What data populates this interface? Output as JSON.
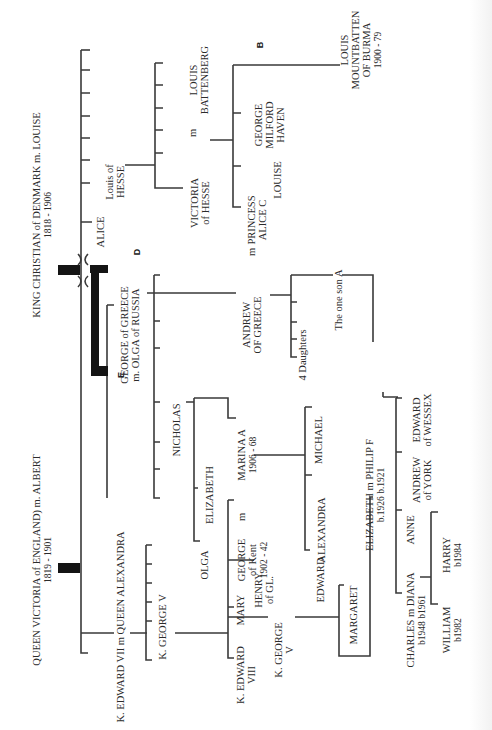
{
  "diagram": {
    "orientation": "rotated -90 degrees (read bottom to top)",
    "colors": {
      "line": "#3a3a3a",
      "text": "#2b2b2b",
      "bar": "#141414",
      "background": "#ffffff"
    },
    "labels": [
      {
        "id": "victoria",
        "lines": [
          "QUEEN VICTORIA of ENGLAND)  m. ALBERT",
          "1819 - 1901"
        ],
        "x": 40,
        "y": 560
      },
      {
        "id": "christian",
        "lines": [
          "KING CHRISTIAN of DENMARK   m. LOUISE",
          "1818 - 1906"
        ],
        "x": 40,
        "y": 215
      },
      {
        "id": "edward-vii",
        "lines": [
          "K. EDWARD VII   m  QUEEN ALEXANDRA"
        ],
        "x": 124,
        "y": 627
      },
      {
        "id": "marker-e",
        "lines": [
          "E"
        ],
        "x": 124,
        "y": 375,
        "bold": true
      },
      {
        "id": "george-v-1",
        "lines": [
          "K. GEORGE V"
        ],
        "x": 166,
        "y": 627
      },
      {
        "id": "george-greece",
        "lines": [
          "GEORGE of GREECE",
          "m. OLGA of RUSSIA"
        ],
        "x": 128,
        "y": 335
      },
      {
        "id": "marker-d",
        "lines": [
          "D"
        ],
        "x": 140,
        "y": 252,
        "bold": true
      },
      {
        "id": "alice",
        "lines": [
          "ALICE"
        ],
        "x": 104,
        "y": 232
      },
      {
        "id": "louis-hesse",
        "lines": [
          "Louis of",
          "HESSE"
        ],
        "x": 113,
        "y": 182
      },
      {
        "id": "victoria-hesse",
        "lines": [
          "VICTORIA",
          "of HESSE"
        ],
        "x": 198,
        "y": 203
      },
      {
        "id": "m-1",
        "lines": [
          "m"
        ],
        "x": 196,
        "y": 133
      },
      {
        "id": "louis-battenberg",
        "lines": [
          "LOUIS",
          "BATTENBERG"
        ],
        "x": 197,
        "y": 80
      },
      {
        "id": "princess-alice",
        "lines": [
          "PRINCESS",
          "ALICE C"
        ],
        "x": 255,
        "y": 220
      },
      {
        "id": "louise",
        "lines": [
          "LOUISE"
        ],
        "x": 281,
        "y": 180
      },
      {
        "id": "george-milford",
        "lines": [
          "GEORGE",
          "MILFORD",
          "HAVEN"
        ],
        "x": 262,
        "y": 125
      },
      {
        "id": "marker-b",
        "lines": [
          "B"
        ],
        "x": 263,
        "y": 45,
        "bold": true
      },
      {
        "id": "louis-mountbatten",
        "lines": [
          "LOUIS",
          "MOUNTBATTEN",
          "OF BURMA",
          "1900 - 79"
        ],
        "x": 348,
        "y": 50
      },
      {
        "id": "m-2",
        "lines": [
          "m"
        ],
        "x": 255,
        "y": 252
      },
      {
        "id": "andrew-greece",
        "lines": [
          "ANDREW",
          "OF GREECE"
        ],
        "x": 250,
        "y": 325
      },
      {
        "id": "one-son",
        "lines": [
          "The one son  A"
        ],
        "x": 342,
        "y": 300
      },
      {
        "id": "four-daughters",
        "lines": [
          "4 Daughters"
        ],
        "x": 306,
        "y": 355
      },
      {
        "id": "nicholas",
        "lines": [
          "NICHOLAS"
        ],
        "x": 180,
        "y": 430
      },
      {
        "id": "marina",
        "lines": [
          "MARINA  A",
          "1906 - 68"
        ],
        "x": 245,
        "y": 455
      },
      {
        "id": "elizabeth-1",
        "lines": [
          "ELIZABETH"
        ],
        "x": 213,
        "y": 495
      },
      {
        "id": "m-3",
        "lines": [
          "m"
        ],
        "x": 245,
        "y": 517
      },
      {
        "id": "george-kent",
        "lines": [
          "GEORGE",
          "of Kent",
          "1902 - 42"
        ],
        "x": 245,
        "y": 560
      },
      {
        "id": "olga",
        "lines": [
          "OLGA"
        ],
        "x": 208,
        "y": 565
      },
      {
        "id": "alexandra",
        "lines": [
          "ALEXANDRA"
        ],
        "x": 325,
        "y": 530
      },
      {
        "id": "michael",
        "lines": [
          "MICHAEL"
        ],
        "x": 322,
        "y": 440
      },
      {
        "id": "edward-kent",
        "lines": [
          "EDWARD"
        ],
        "x": 324,
        "y": 580
      },
      {
        "id": "mary",
        "lines": [
          "MARY"
        ],
        "x": 244,
        "y": 610
      },
      {
        "id": "henry",
        "lines": [
          "HENRY",
          "of GL."
        ],
        "x": 262,
        "y": 590
      },
      {
        "id": "edward-viii",
        "lines": [
          "K. EDWARD",
          "VIII"
        ],
        "x": 244,
        "y": 675
      },
      {
        "id": "george-vi",
        "lines": [
          "K. GEORGE",
          "V"
        ],
        "x": 282,
        "y": 650
      },
      {
        "id": "margaret",
        "lines": [
          "MARGARET"
        ],
        "x": 357,
        "y": 615
      },
      {
        "id": "elizabeth-ii",
        "lines": [
          "ELIZABETH  m  PHILIP F",
          "b.1926          b.1921"
        ],
        "x": 373,
        "y": 495
      },
      {
        "id": "edward-wessex",
        "lines": [
          "EDWARD",
          "of WESSEX"
        ],
        "x": 420,
        "y": 420
      },
      {
        "id": "andrew-york",
        "lines": [
          "ANDREW",
          "of YORK"
        ],
        "x": 420,
        "y": 480
      },
      {
        "id": "anne",
        "lines": [
          "ANNE"
        ],
        "x": 414,
        "y": 530
      },
      {
        "id": "charles",
        "lines": [
          "CHARLES   m  DIANA",
          "b1948          b1961"
        ],
        "x": 414,
        "y": 620
      },
      {
        "id": "william",
        "lines": [
          "WILLIAM",
          "b1982"
        ],
        "x": 450,
        "y": 630
      },
      {
        "id": "harry",
        "lines": [
          "HARRY",
          "b1984"
        ],
        "x": 450,
        "y": 555
      }
    ]
  }
}
